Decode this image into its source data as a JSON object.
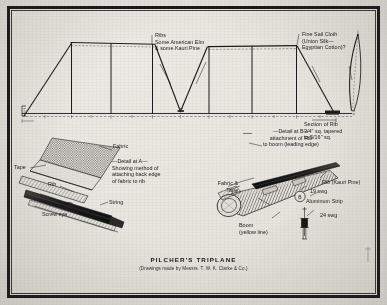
{
  "plate": {
    "title": "PILCHER'S TRIPLANE",
    "subtitle": "(Drawings made by Messrs. T. W. K. Clarke & Co.)"
  },
  "plan_view": {
    "labels": {
      "ribs": "Ribs\nSome American Elm\n& some Kauri Pine",
      "sail_cloth": "Fine Sail Cloth\n(Union Silk—\nEgyptian Cotton)?",
      "section_of_rib": "Section of Rib\n3/4\" sq. tapered\nto 5/16\" sq."
    }
  },
  "detail_a": {
    "caption": "—Detail at A—\nShowing method of\nattaching back edge\nof fabric to rib",
    "labels": {
      "fabric": "Fabric",
      "tape": "Tape",
      "rib": "Rib",
      "string": "String",
      "screw_eye": "Screw eye"
    }
  },
  "detail_b": {
    "caption": "—Detail at B—\nattachment of Rib\nto boom (leading edge)",
    "labels": {
      "fabric_and_tape": "Fabric &\nTape",
      "rib": "Rib (Kauri Pine)",
      "gauge_19": "19 swg",
      "aluminum_strip": "Aluminum Strip",
      "gauge_24": "24 swg",
      "boom": "Boom\n(yellow line)"
    }
  },
  "colors": {
    "ink": "#1b1b1d",
    "paper": "#eceae4",
    "frame": "#17171a",
    "rule": "#3a3a3c"
  }
}
